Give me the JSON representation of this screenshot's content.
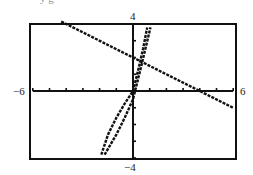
{
  "header": {
    "cutoff_text": "y  g"
  },
  "chart_data": {
    "type": "line",
    "title": "",
    "xlabel": "",
    "ylabel": "",
    "xlim": [
      -6,
      6
    ],
    "ylim": [
      -4,
      4
    ],
    "xscl": 1,
    "yscl": 1,
    "grid": false,
    "frame": true,
    "tick_labels": {
      "xmin": "−6",
      "xmax": "6",
      "ymin": "−4",
      "ymax": "4"
    },
    "series": [
      {
        "name": "line",
        "style": "dotted-thick",
        "x": [
          -4.3,
          6
        ],
        "y": [
          4.15,
          -1.0
        ]
      },
      {
        "name": "curve-a",
        "style": "dotted-thick",
        "x": [
          -1.9,
          -1.5,
          -1.0,
          -0.5,
          0,
          0.3,
          0.6,
          0.85
        ],
        "y": [
          -3.8,
          -2.6,
          -1.6,
          -0.75,
          0,
          1.2,
          2.5,
          3.8
        ]
      },
      {
        "name": "curve-b",
        "style": "dotted-thick",
        "x": [
          -1.7,
          -1.0,
          -0.5,
          0,
          0.5,
          1.05
        ],
        "y": [
          -3.8,
          -2.6,
          -1.6,
          -0.5,
          1.5,
          3.8
        ]
      }
    ]
  }
}
